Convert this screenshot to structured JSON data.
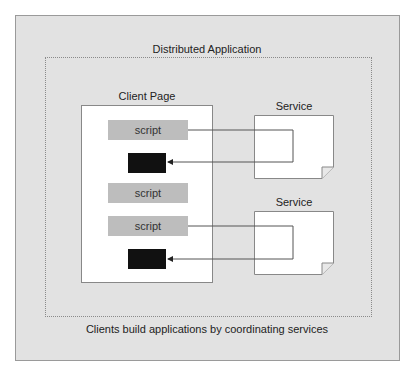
{
  "diagram": {
    "title": "Distributed Application",
    "caption": "Clients build applications by coordinating services",
    "client_page": {
      "label": "Client Page",
      "scripts": [
        "script",
        "script",
        "script"
      ]
    },
    "services": [
      {
        "label": "Service"
      },
      {
        "label": "Service"
      }
    ],
    "colors": {
      "panel": "#e2e2e2",
      "script": "#bdbdbd",
      "output": "#111111"
    }
  }
}
